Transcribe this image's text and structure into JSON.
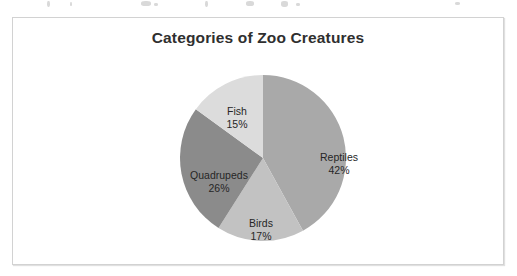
{
  "chart_data": {
    "type": "pie",
    "title": "Categories of Zoo Creatures",
    "xlabel": "",
    "ylabel": "",
    "legend": "none",
    "labels_position": "inside-slices",
    "start_angle_deg": 0,
    "direction": "clockwise",
    "categories": [
      "Reptiles",
      "Birds",
      "Quadrupeds",
      "Fish"
    ],
    "values": [
      42,
      17,
      26,
      15
    ],
    "value_unit": "%",
    "slices": [
      {
        "label": "Reptiles",
        "value": 42,
        "display_value": "42%",
        "color": "#a9a9a9"
      },
      {
        "label": "Birds",
        "value": 17,
        "display_value": "17%",
        "color": "#c2c2c2"
      },
      {
        "label": "Quadrupeds",
        "value": 26,
        "display_value": "26%",
        "color": "#8b8b8b"
      },
      {
        "label": "Fish",
        "value": 15,
        "display_value": "15%",
        "color": "#dcdcdc"
      }
    ]
  },
  "chart": {
    "title": "Categories of Zoo Creatures",
    "frame_border_color": "#d2d2d2",
    "background_color": "#ffffff",
    "title_color": "#2f2f2f",
    "label_color": "#262626"
  },
  "labels": {
    "reptiles": {
      "name": "Reptiles",
      "percent": "42%"
    },
    "birds": {
      "name": "Birds",
      "percent": "17%"
    },
    "quadrupeds": {
      "name": "Quadrupeds",
      "percent": "26%"
    },
    "fish": {
      "name": "Fish",
      "percent": "15%"
    }
  }
}
